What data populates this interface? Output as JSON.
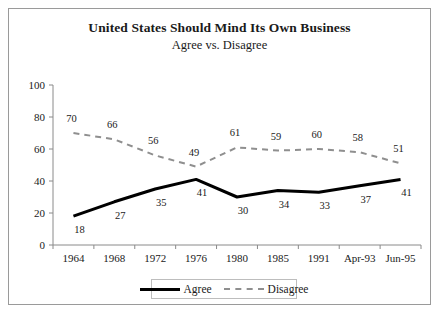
{
  "chart_data": {
    "type": "line",
    "title": "United States Should Mind Its Own Business",
    "subtitle": "Agree vs. Disagree",
    "xlabel": "",
    "ylabel": "",
    "ylim": [
      0,
      100
    ],
    "ytick_labels": [
      "0",
      "20",
      "40",
      "60",
      "80",
      "100"
    ],
    "yticks": [
      0,
      20,
      40,
      60,
      80,
      100
    ],
    "grid": false,
    "legend_position": "bottom-center",
    "categories": [
      "1964",
      "1968",
      "1972",
      "1976",
      "1980",
      "1985",
      "1991",
      "Apr-93",
      "Jun-95"
    ],
    "series": [
      {
        "name": "Agree",
        "values": [
          18,
          27,
          35,
          41,
          30,
          34,
          33,
          37,
          41
        ],
        "color": "#000000",
        "style": "solid"
      },
      {
        "name": "Disagree",
        "values": [
          70,
          66,
          56,
          49,
          61,
          59,
          60,
          58,
          51
        ],
        "color": "#8f8f8f",
        "style": "dashed"
      }
    ]
  },
  "legend": {
    "agree_label": "Agree",
    "disagree_label": "Disagree"
  }
}
